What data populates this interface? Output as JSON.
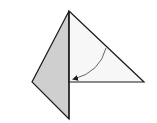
{
  "diagram": {
    "colors": {
      "background": "#ffffff",
      "outline": "#1a1a1a",
      "shaded_face": "#cfcfcf",
      "white_face": "#f7f7f7",
      "arrow": "#555555"
    },
    "shapes": {
      "left_shaded_panel": {
        "points": "69,11 32,82 69,119"
      },
      "right_white_flap": {
        "points": "69,11 144,82 69,82"
      }
    },
    "arrow": {
      "path": "M106,48 Q100,72 74,79",
      "meaning": "fold flap toward center"
    }
  }
}
